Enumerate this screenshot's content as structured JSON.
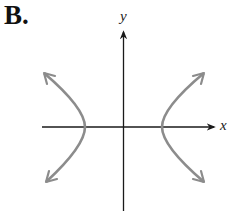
{
  "figure": {
    "option_label": "B.",
    "x_axis_label": "x",
    "y_axis_label": "y",
    "colors": {
      "axes": "#1a1a1a",
      "curve": "#8c8c8c",
      "background": "#ffffff"
    }
  }
}
